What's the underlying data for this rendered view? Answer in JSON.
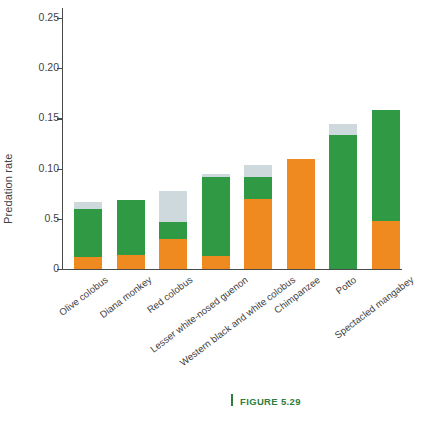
{
  "figure": {
    "caption_label": "FIGURE 5.29",
    "caption_rule": "caption-rule",
    "accent_color": "#2e7d3a"
  },
  "axes": {
    "y_title": "Predation rate",
    "y_ticks": [
      "0.25",
      "0.20",
      "0.15",
      "0.10",
      "0.5",
      "0"
    ],
    "y_tick_values": [
      0.25,
      0.2,
      0.15,
      0.1,
      0.05,
      0
    ],
    "x_title": ""
  },
  "chart_data": {
    "type": "bar",
    "title": "",
    "subtitle": "",
    "xlabel": "",
    "ylabel": "Predation rate",
    "ylim": [
      0,
      0.25
    ],
    "ytick_labels": [
      "0",
      "0.5",
      "0.10",
      "0.15",
      "0.20",
      "0.25"
    ],
    "ytick_values": [
      0,
      0.05,
      0.1,
      0.15,
      0.2,
      0.25
    ],
    "grid": false,
    "legend": null,
    "stacked": true,
    "categories": [
      "Olive colobus",
      "Diana monkey",
      "Red colobus",
      "Lesser white-nosed guenon",
      "Western black and white colobus",
      "Chimpanzee",
      "Potto",
      "Spectacled mangabey"
    ],
    "series": [
      {
        "name": "orange-segment",
        "color": "#ef8a21",
        "values": [
          0.0115,
          0.0135,
          0.0295,
          0.0125,
          0.07,
          0.1095,
          0.0,
          0.048
        ]
      },
      {
        "name": "green-segment",
        "color": "#2f9943",
        "values": [
          0.0485,
          0.0555,
          0.0175,
          0.0795,
          0.022,
          0.0,
          0.133,
          0.11
        ]
      },
      {
        "name": "light-gray-segment",
        "color": "#cdd9dc",
        "values": [
          0.007,
          0.0,
          0.031,
          0.003,
          0.0115,
          0.0,
          0.011,
          0.0
        ]
      }
    ],
    "totals": [
      0.067,
      0.069,
      0.078,
      0.095,
      0.1035,
      0.1095,
      0.144,
      0.158
    ]
  },
  "bars": [
    {
      "category": "Olive colobus",
      "orange": 0.0115,
      "green": 0.0485,
      "gray": 0.007,
      "total": 0.067
    },
    {
      "category": "Diana monkey",
      "orange": 0.0135,
      "green": 0.0555,
      "gray": 0.0,
      "total": 0.069
    },
    {
      "category": "Red colobus",
      "orange": 0.0295,
      "green": 0.0175,
      "gray": 0.031,
      "total": 0.078
    },
    {
      "category": "Lesser white-nosed guenon",
      "orange": 0.0125,
      "green": 0.0795,
      "gray": 0.003,
      "total": 0.095
    },
    {
      "category": "Western black and white colobus",
      "orange": 0.07,
      "green": 0.022,
      "gray": 0.0115,
      "total": 0.1035
    },
    {
      "category": "Chimpanzee",
      "orange": 0.1095,
      "green": 0.0,
      "gray": 0.0,
      "total": 0.1095
    },
    {
      "category": "Potto",
      "orange": 0.0,
      "green": 0.133,
      "gray": 0.011,
      "total": 0.144
    },
    {
      "category": "Spectacled mangabey",
      "orange": 0.048,
      "green": 0.11,
      "gray": 0.0,
      "total": 0.158
    }
  ],
  "colors": {
    "orange": "#ef8a21",
    "green": "#2f9943",
    "light_gray": "#cdd9dc",
    "axis": "#4a4a4a",
    "text": "#3c3c3c",
    "caption_green": "#2e7d3a"
  }
}
